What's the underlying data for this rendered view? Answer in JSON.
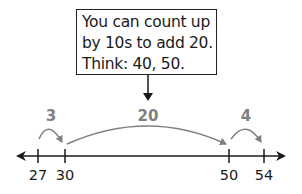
{
  "callout": {
    "lines": [
      "You can count up",
      "by 10s to add 20.",
      "Think: 40, 50."
    ]
  },
  "number_line": {
    "ticks": [
      {
        "value": "27",
        "x": 38
      },
      {
        "value": "30",
        "x": 65
      },
      {
        "value": "50",
        "x": 229
      },
      {
        "value": "54",
        "x": 264
      }
    ],
    "jumps": [
      {
        "label": "3",
        "from": "27",
        "to": "30",
        "x": 51
      },
      {
        "label": "20",
        "from": "30",
        "to": "50",
        "x": 148
      },
      {
        "label": "4",
        "from": "50",
        "to": "54",
        "x": 247
      }
    ]
  },
  "colors": {
    "line": "#1a1a1a",
    "jump_arrow": "#808080"
  }
}
